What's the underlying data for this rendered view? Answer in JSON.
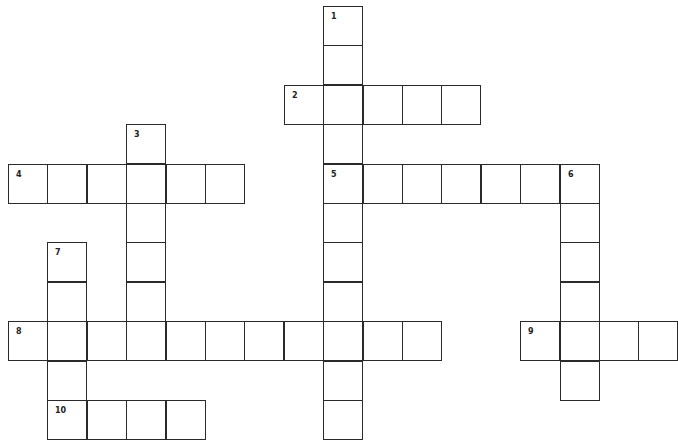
{
  "puzzle": {
    "type": "crossword",
    "cell_size": 39.4,
    "origin": {
      "x": 8,
      "y": 6
    },
    "clue_numbers": [
      "1",
      "2",
      "3",
      "4",
      "5",
      "6",
      "7",
      "8",
      "9",
      "10"
    ],
    "entries": [
      {
        "number": "1",
        "direction": "down",
        "row": 0,
        "col": 8,
        "length": 11
      },
      {
        "number": "2",
        "direction": "across",
        "row": 2,
        "col": 7,
        "length": 5
      },
      {
        "number": "3",
        "direction": "down",
        "row": 3,
        "col": 3,
        "length": 5
      },
      {
        "number": "4",
        "direction": "across",
        "row": 4,
        "col": 0,
        "length": 6
      },
      {
        "number": "5",
        "direction": "across",
        "row": 4,
        "col": 8,
        "length": 7
      },
      {
        "number": "6",
        "direction": "down",
        "row": 4,
        "col": 14,
        "length": 6
      },
      {
        "number": "7",
        "direction": "down",
        "row": 6,
        "col": 1,
        "length": 5
      },
      {
        "number": "8",
        "direction": "across",
        "row": 8,
        "col": 0,
        "length": 11
      },
      {
        "number": "9",
        "direction": "across",
        "row": 8,
        "col": 13,
        "length": 4
      },
      {
        "number": "10",
        "direction": "across",
        "row": 10,
        "col": 1,
        "length": 4
      }
    ]
  },
  "colors": {
    "border": "#2a2a2a",
    "background": "#ffffff",
    "number": "#222222"
  }
}
